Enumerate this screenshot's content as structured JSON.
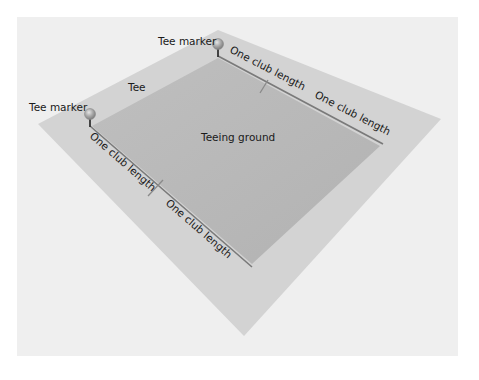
{
  "diagram": {
    "colors": {
      "page_background": "#ffffff",
      "panel_background": "#efefef",
      "tee_area": "#d3d3d3",
      "teeing_ground": "#b9b9b9",
      "edge_line": "#7a7a7a",
      "marker": "#a9a9a9"
    },
    "labels": {
      "tee_marker_top": "Tee marker",
      "tee_marker_left": "Tee marker",
      "tee": "Tee",
      "teeing_ground": "Teeing ground",
      "top_edge_first": "One club length",
      "top_edge_second": "One club length",
      "left_edge_first": "One club length",
      "left_edge_second": "One club length"
    },
    "icons": {
      "tee_marker": "sphere-on-stem"
    }
  }
}
